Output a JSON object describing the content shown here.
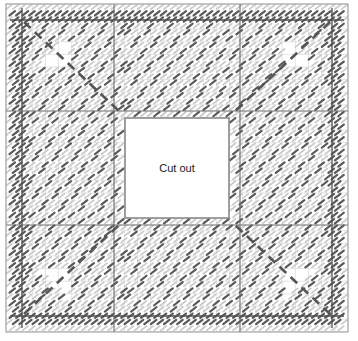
{
  "diagram": {
    "type": "structural-reinforcement-plan",
    "canvas": {
      "width": 358,
      "height": 341
    },
    "frame": {
      "x": 6,
      "y": 4,
      "width": 342,
      "height": 328,
      "border_color": "#9a9a9a",
      "border_width": 1
    },
    "grid": {
      "visible": true,
      "cell_width": 13.15,
      "cell_height": 12.6,
      "columns": 26,
      "rows": 26,
      "line_color": "#d2d2d2",
      "line_width": 0.6
    },
    "axes": {
      "visible": true,
      "color": "#6a6a6a",
      "line_width": 1.1,
      "vertical_x": [
        114,
        240
      ],
      "horizontal_y": [
        111,
        225
      ],
      "note": "darker setting-out / column grid lines"
    },
    "cutout": {
      "label": "Cut out",
      "x": 125,
      "y": 118,
      "width": 104,
      "height": 100,
      "fill": "#ffffff",
      "border_color": "#8a8a8a",
      "border_width": 1.6,
      "label_x": 177,
      "label_y": 169
    },
    "hatch": {
      "light_color": "#c9c9c9",
      "dark_color": "#595959",
      "stroke_length": 7,
      "stroke_width": 2.2,
      "angle_deg": -38,
      "step_x": 13.15,
      "step_y": 12.6,
      "note": "short inclined tick marks representing bar ends"
    },
    "perimeter_bands": {
      "description": "dark reinforcement runs along all four edges",
      "inset": 16,
      "band_thickness": 13,
      "color": "#4f4f4f"
    },
    "diagonals": {
      "description": "dashed dark diagonal bars from each corner toward the cut out",
      "color": "#565656",
      "line_width": 2.6,
      "dash": "9 6",
      "corners": [
        {
          "name": "top-left",
          "x1": 24,
          "y1": 22,
          "x2": 120,
          "y2": 112
        },
        {
          "name": "top-right",
          "x1": 330,
          "y1": 22,
          "x2": 234,
          "y2": 112
        },
        {
          "name": "bottom-left",
          "x1": 24,
          "y1": 314,
          "x2": 120,
          "y2": 224
        },
        {
          "name": "bottom-right",
          "x1": 330,
          "y1": 314,
          "x2": 234,
          "y2": 224
        }
      ]
    },
    "colors": {
      "background": "#ffffff",
      "grid": "#d2d2d2",
      "axis": "#6a6a6a",
      "frame": "#9a9a9a",
      "hatch_light": "#c9c9c9",
      "hatch_dark": "#595959",
      "text": "#1a1a1a"
    }
  }
}
